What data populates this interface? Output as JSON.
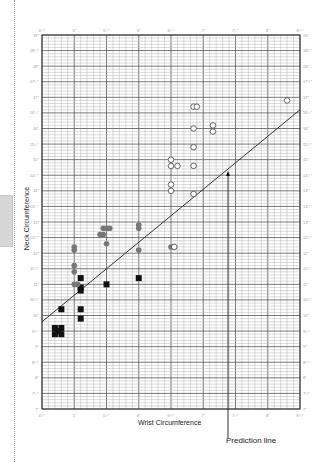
{
  "chart_data": {
    "type": "scatter",
    "title": "",
    "xlabel": "Wrist Circumference",
    "ylabel": "Neck Circumference",
    "xlim": [
      4.5,
      8.5
    ],
    "ylim": [
      7,
      19
    ],
    "x_ticks": [
      "4½\"",
      "5\"",
      "5½\"",
      "6\"",
      "6½\"",
      "7\"",
      "7½\"",
      "8\"",
      "8½\""
    ],
    "y_ticks": [
      "7\"",
      "7½\"",
      "8\"",
      "8½\"",
      "9\"",
      "9½\"",
      "10\"",
      "10½\"",
      "11\"",
      "11½\"",
      "12\"",
      "12½\"",
      "13\"",
      "13½\"",
      "14\"",
      "14½\"",
      "15\"",
      "15½\"",
      "16\"",
      "16½\"",
      "17\"",
      "17½\"",
      "18\"",
      "18½\"",
      "19\""
    ],
    "grid": true,
    "annotation": "Prediction line",
    "prediction_line": {
      "x": [
        4.5,
        8.5
      ],
      "y": [
        9.8,
        16.6
      ]
    },
    "series": [
      {
        "name": "group-square",
        "marker": "filled-square",
        "color": "#111111",
        "points": [
          [
            4.8,
            10.2
          ],
          [
            4.7,
            9.6
          ],
          [
            4.8,
            9.6
          ],
          [
            4.7,
            9.4
          ],
          [
            4.8,
            9.4
          ],
          [
            4.75,
            9.5
          ],
          [
            5.1,
            11.2
          ],
          [
            5.1,
            10.9
          ],
          [
            5.1,
            10.8
          ],
          [
            5.1,
            10.2
          ],
          [
            5.1,
            9.9
          ],
          [
            5.5,
            11.0
          ],
          [
            6.0,
            11.2
          ]
        ]
      },
      {
        "name": "group-gray",
        "marker": "filled-circle",
        "color": "#777777",
        "points": [
          [
            5.0,
            12.2
          ],
          [
            5.0,
            12.1
          ],
          [
            5.0,
            11.6
          ],
          [
            5.0,
            11.4
          ],
          [
            5.0,
            11.0
          ],
          [
            5.05,
            11.0
          ],
          [
            5.45,
            12.8
          ],
          [
            5.45,
            12.6
          ],
          [
            5.5,
            12.8
          ],
          [
            5.55,
            12.8
          ],
          [
            5.4,
            12.6
          ],
          [
            5.5,
            12.3
          ],
          [
            6.0,
            12.9
          ],
          [
            6.0,
            12.8
          ],
          [
            6.0,
            12.1
          ],
          [
            6.5,
            12.2
          ]
        ]
      },
      {
        "name": "group-open",
        "marker": "open-circle",
        "color": "#444444",
        "points": [
          [
            6.55,
            12.2
          ],
          [
            6.5,
            15.0
          ],
          [
            6.5,
            14.8
          ],
          [
            6.6,
            14.8
          ],
          [
            6.5,
            14.2
          ],
          [
            6.5,
            14.0
          ],
          [
            6.85,
            16.7
          ],
          [
            6.9,
            16.7
          ],
          [
            6.85,
            16.0
          ],
          [
            6.85,
            15.4
          ],
          [
            6.85,
            14.8
          ],
          [
            6.85,
            13.9
          ],
          [
            7.15,
            16.1
          ],
          [
            7.15,
            15.9
          ],
          [
            8.3,
            16.9
          ]
        ]
      }
    ]
  },
  "labels": {
    "ylabel": "Neck Circumference",
    "xlabel": "Wrist Circumference",
    "prediction": "Prediction line"
  }
}
